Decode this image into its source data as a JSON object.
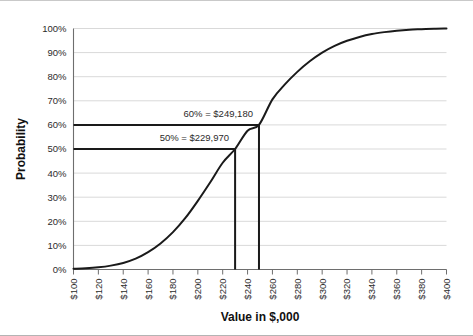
{
  "chart_data": {
    "type": "line",
    "title": "",
    "xlabel": "Value in $,000",
    "ylabel": "Probability",
    "xlim": [
      100,
      400
    ],
    "ylim": [
      0,
      1
    ],
    "grid": true,
    "legend": "none",
    "x_tick_labels": [
      "$100",
      "$120",
      "$140",
      "$160",
      "$180",
      "$200",
      "$220",
      "$240",
      "$260",
      "$280",
      "$300",
      "$320",
      "$340",
      "$360",
      "$380",
      "$400"
    ],
    "x_tick_values": [
      100,
      120,
      140,
      160,
      180,
      200,
      220,
      240,
      260,
      280,
      300,
      320,
      340,
      360,
      380,
      400
    ],
    "y_tick_labels": [
      "0%",
      "10%",
      "20%",
      "30%",
      "40%",
      "50%",
      "60%",
      "70%",
      "80%",
      "90%",
      "100%"
    ],
    "y_tick_values": [
      0,
      0.1,
      0.2,
      0.3,
      0.4,
      0.5,
      0.6,
      0.7,
      0.8,
      0.9,
      1.0
    ],
    "series": [
      {
        "name": "Cumulative probability",
        "color": "#1a1a1a",
        "x": [
          100,
          110,
          120,
          130,
          140,
          150,
          160,
          170,
          180,
          190,
          200,
          210,
          220,
          229.97,
          240,
          249.18,
          260,
          270,
          280,
          290,
          300,
          310,
          320,
          330,
          340,
          350,
          360,
          370,
          380,
          390,
          400
        ],
        "values": [
          0.003,
          0.005,
          0.009,
          0.016,
          0.027,
          0.045,
          0.072,
          0.108,
          0.155,
          0.214,
          0.285,
          0.362,
          0.443,
          0.5,
          0.576,
          0.6,
          0.706,
          0.768,
          0.82,
          0.864,
          0.9,
          0.928,
          0.949,
          0.965,
          0.977,
          0.985,
          0.991,
          0.995,
          0.997,
          0.999,
          1.0
        ]
      }
    ],
    "reference_lines": [
      {
        "id": "p60",
        "probability": 0.6,
        "value": 249.18,
        "label": "60% = $249,180"
      },
      {
        "id": "p50",
        "probability": 0.5,
        "value": 229.97,
        "label": "50% = $229,970"
      }
    ],
    "annotations": [
      {
        "text": "60% = $249,180"
      },
      {
        "text": "50% = $229,970"
      }
    ],
    "colors": {
      "curve": "#1a1a1a",
      "gridline": "#d9d9d9",
      "axis": "#6e6e6e",
      "reference_line": "#1a1a1a",
      "background": "#ffffff"
    }
  }
}
